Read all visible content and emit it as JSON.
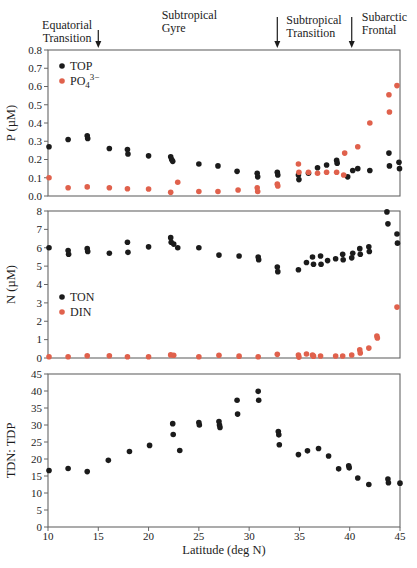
{
  "figure": {
    "x_axis": {
      "label": "Latitude (deg N)",
      "min": 10,
      "max": 45,
      "ticks": [
        10,
        15,
        20,
        25,
        30,
        35,
        40,
        45
      ]
    },
    "colors": {
      "black": "#1b1b1b",
      "orange": "#E0614C",
      "frame": "#666666",
      "text": "#1c1c1c"
    },
    "annotations": [
      {
        "lines": [
          "Equatorial",
          "Transition"
        ],
        "anchor_lat": 11.9,
        "align": "middle",
        "arrow_lat": 15.0
      },
      {
        "lines": [
          "Subtropical",
          "Gyre"
        ],
        "anchor_lat": 21.3,
        "align": "start",
        "arrow_lat": null
      },
      {
        "lines": [
          "Subtropical",
          "Transition"
        ],
        "anchor_lat": 33.7,
        "align": "start",
        "arrow_lat": 32.8
      },
      {
        "lines": [
          "Subarctic",
          "Frontal"
        ],
        "anchor_lat": 41.2,
        "align": "start",
        "arrow_lat": 40.2
      }
    ]
  },
  "chart_data": [
    {
      "type": "scatter",
      "id": "phosphorus",
      "ylabel": "P (µM)",
      "ylim": [
        0,
        0.8
      ],
      "ytick_step": 0.1,
      "ytick_labels": [
        "0.0",
        "0.1",
        "0.2",
        "0.3",
        "0.4",
        "0.5",
        "0.6",
        "0.7",
        "0.8"
      ],
      "xlabel": "",
      "grid": false,
      "legend_position": "top-left",
      "series": [
        {
          "name": "TOP",
          "color_key": "black",
          "points": [
            [
              10.1,
              0.27
            ],
            [
              12.0,
              0.31
            ],
            [
              13.9,
              0.33
            ],
            [
              13.95,
              0.315
            ],
            [
              16.1,
              0.26
            ],
            [
              17.9,
              0.255
            ],
            [
              17.95,
              0.23
            ],
            [
              20.0,
              0.22
            ],
            [
              22.2,
              0.215
            ],
            [
              22.3,
              0.2
            ],
            [
              22.4,
              0.19
            ],
            [
              25.0,
              0.175
            ],
            [
              26.9,
              0.165
            ],
            [
              28.8,
              0.135
            ],
            [
              30.8,
              0.125
            ],
            [
              30.85,
              0.105
            ],
            [
              32.8,
              0.13
            ],
            [
              32.85,
              0.115
            ],
            [
              34.9,
              0.115
            ],
            [
              34.95,
              0.09
            ],
            [
              35.9,
              0.125
            ],
            [
              36.8,
              0.155
            ],
            [
              37.7,
              0.17
            ],
            [
              38.7,
              0.195
            ],
            [
              38.75,
              0.18
            ],
            [
              39.8,
              0.105
            ],
            [
              40.3,
              0.14
            ],
            [
              40.8,
              0.15
            ],
            [
              42.0,
              0.14
            ],
            [
              43.9,
              0.235
            ],
            [
              43.95,
              0.165
            ],
            [
              44.9,
              0.185
            ],
            [
              44.95,
              0.15
            ]
          ]
        },
        {
          "name": "PO4",
          "rich_label": {
            "base": "PO",
            "sub": "4",
            "sup": "3−"
          },
          "color_key": "orange",
          "points": [
            [
              10.1,
              0.1
            ],
            [
              12.0,
              0.045
            ],
            [
              13.9,
              0.05
            ],
            [
              16.1,
              0.045
            ],
            [
              17.9,
              0.04
            ],
            [
              20.0,
              0.038
            ],
            [
              22.2,
              0.02
            ],
            [
              22.9,
              0.075
            ],
            [
              25.0,
              0.025
            ],
            [
              26.9,
              0.025
            ],
            [
              28.9,
              0.033
            ],
            [
              30.8,
              0.045
            ],
            [
              30.85,
              0.025
            ],
            [
              32.8,
              0.065
            ],
            [
              32.85,
              0.055
            ],
            [
              34.9,
              0.175
            ],
            [
              34.95,
              0.13
            ],
            [
              35.9,
              0.13
            ],
            [
              36.8,
              0.125
            ],
            [
              37.7,
              0.13
            ],
            [
              38.7,
              0.13
            ],
            [
              39.4,
              0.115
            ],
            [
              39.5,
              0.235
            ],
            [
              40.8,
              0.27
            ],
            [
              42.0,
              0.4
            ],
            [
              43.9,
              0.555
            ],
            [
              43.95,
              0.46
            ],
            [
              44.7,
              0.605
            ]
          ]
        }
      ]
    },
    {
      "type": "scatter",
      "id": "nitrogen",
      "ylabel": "N (µM)",
      "ylim": [
        0,
        8
      ],
      "ytick_step": 1,
      "ytick_labels": [
        "0",
        "1",
        "2",
        "3",
        "4",
        "5",
        "6",
        "7",
        "8"
      ],
      "xlabel": "",
      "grid": false,
      "legend_position": "mid-left",
      "series": [
        {
          "name": "TON",
          "color_key": "black",
          "points": [
            [
              10.1,
              6.0
            ],
            [
              12.0,
              5.85
            ],
            [
              12.05,
              5.65
            ],
            [
              13.9,
              5.95
            ],
            [
              13.95,
              5.8
            ],
            [
              16.1,
              5.7
            ],
            [
              17.9,
              6.3
            ],
            [
              17.95,
              5.75
            ],
            [
              20.0,
              6.05
            ],
            [
              22.2,
              6.55
            ],
            [
              22.25,
              6.3
            ],
            [
              22.5,
              6.2
            ],
            [
              22.9,
              6.0
            ],
            [
              25.0,
              6.0
            ],
            [
              27.0,
              5.6
            ],
            [
              29.0,
              5.55
            ],
            [
              30.9,
              5.5
            ],
            [
              30.95,
              5.35
            ],
            [
              32.8,
              4.95
            ],
            [
              32.85,
              4.7
            ],
            [
              34.9,
              4.8
            ],
            [
              35.7,
              5.2
            ],
            [
              36.3,
              5.5
            ],
            [
              36.4,
              5.1
            ],
            [
              37.1,
              5.55
            ],
            [
              37.15,
              5.1
            ],
            [
              37.8,
              5.3
            ],
            [
              38.6,
              5.4
            ],
            [
              39.3,
              5.65
            ],
            [
              39.35,
              5.35
            ],
            [
              40.2,
              5.45
            ],
            [
              40.3,
              5.7
            ],
            [
              41.0,
              5.95
            ],
            [
              41.05,
              5.65
            ],
            [
              41.9,
              6.05
            ],
            [
              41.95,
              5.8
            ],
            [
              43.7,
              7.95
            ],
            [
              43.8,
              7.3
            ],
            [
              44.7,
              6.75
            ],
            [
              44.75,
              6.25
            ]
          ]
        },
        {
          "name": "DIN",
          "color_key": "orange",
          "points": [
            [
              10.1,
              0.07
            ],
            [
              12.0,
              0.07
            ],
            [
              13.9,
              0.12
            ],
            [
              16.1,
              0.12
            ],
            [
              17.9,
              0.07
            ],
            [
              20.0,
              0.07
            ],
            [
              22.2,
              0.17
            ],
            [
              22.5,
              0.15
            ],
            [
              25.0,
              0.07
            ],
            [
              27.0,
              0.15
            ],
            [
              29.0,
              0.1
            ],
            [
              30.9,
              0.07
            ],
            [
              32.8,
              0.2
            ],
            [
              34.9,
              0.16
            ],
            [
              34.95,
              0.05
            ],
            [
              35.7,
              0.22
            ],
            [
              36.3,
              0.16
            ],
            [
              36.4,
              0.1
            ],
            [
              37.1,
              0.11
            ],
            [
              38.6,
              0.11
            ],
            [
              39.3,
              0.11
            ],
            [
              40.2,
              0.16
            ],
            [
              41.0,
              0.44
            ],
            [
              41.05,
              0.27
            ],
            [
              41.9,
              0.54
            ],
            [
              42.7,
              1.2
            ],
            [
              42.75,
              1.09
            ],
            [
              44.7,
              2.77
            ]
          ]
        }
      ]
    },
    {
      "type": "scatter",
      "id": "tdn-tdp-ratio",
      "ylabel": "TDN: TDP",
      "ylim": [
        0,
        45
      ],
      "ytick_step": 5,
      "ytick_labels": [
        "0",
        "5",
        "10",
        "15",
        "20",
        "25",
        "30",
        "35",
        "40",
        "45"
      ],
      "xlabel": "Latitude (deg N)",
      "grid": false,
      "legend_position": "none",
      "series": [
        {
          "name": "TDN:TDP",
          "color_key": "black",
          "points": [
            [
              10.1,
              16.6
            ],
            [
              12.0,
              17.2
            ],
            [
              13.9,
              16.3
            ],
            [
              16.0,
              19.6
            ],
            [
              18.1,
              22.2
            ],
            [
              20.1,
              24.0
            ],
            [
              22.4,
              30.4
            ],
            [
              22.45,
              27.2
            ],
            [
              23.1,
              22.5
            ],
            [
              25.0,
              30.7
            ],
            [
              25.05,
              30.0
            ],
            [
              27.0,
              31.0
            ],
            [
              27.05,
              30.0
            ],
            [
              27.1,
              29.3
            ],
            [
              28.8,
              37.3
            ],
            [
              28.85,
              33.2
            ],
            [
              30.9,
              39.9
            ],
            [
              30.95,
              37.3
            ],
            [
              32.9,
              28.1
            ],
            [
              32.95,
              27.1
            ],
            [
              33.0,
              24.2
            ],
            [
              34.9,
              21.3
            ],
            [
              35.8,
              22.4
            ],
            [
              36.9,
              23.1
            ],
            [
              37.9,
              20.9
            ],
            [
              38.9,
              17.1
            ],
            [
              39.9,
              18.0
            ],
            [
              39.95,
              17.4
            ],
            [
              40.8,
              14.4
            ],
            [
              41.9,
              12.5
            ],
            [
              43.8,
              14.1
            ],
            [
              43.85,
              13.0
            ],
            [
              45.0,
              12.9
            ]
          ]
        }
      ]
    }
  ]
}
